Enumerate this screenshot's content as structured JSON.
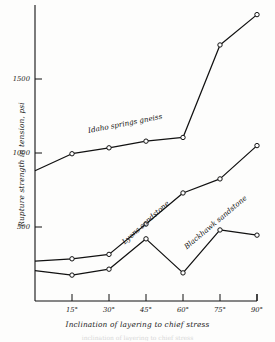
{
  "chart_data": {
    "type": "line",
    "title": "",
    "xlabel": "Inclination of layering to chief stress",
    "ylabel": "Rupture strength in tension, psi",
    "x": [
      0,
      15,
      30,
      45,
      60,
      75,
      90
    ],
    "xtick_labels": [
      "15°",
      "30°",
      "45°",
      "60°",
      "75°",
      "90°"
    ],
    "xtick_values": [
      15,
      30,
      45,
      60,
      75,
      90
    ],
    "ytick_labels": [
      "500",
      "1000",
      "1500"
    ],
    "ytick_values": [
      500,
      1000,
      1500
    ],
    "xlim": [
      0,
      90
    ],
    "ylim": [
      0,
      2000
    ],
    "grid": false,
    "legend_position": "inline-labels",
    "marker": "open-circle",
    "line_color": "#111111",
    "series": [
      {
        "name": "Idaho springs gneiss",
        "label": "Idaho springs gneiss",
        "values": [
          880,
          995,
          1035,
          1080,
          1105,
          1730,
          1935
        ]
      },
      {
        "name": "Lyons sandstone",
        "label": "Lyons sandstone",
        "values": [
          270,
          285,
          315,
          520,
          730,
          825,
          1050
        ]
      },
      {
        "name": "Blackhawk sandstone",
        "label": "Blackhawk sandstone",
        "values": [
          205,
          175,
          215,
          420,
          190,
          480,
          445
        ]
      }
    ],
    "annotations": [
      {
        "text": "Idaho springs gneiss",
        "x": 22,
        "y": 1180,
        "rotation": -11
      },
      {
        "text": "Lyons sandstone",
        "x": 37,
        "y": 430,
        "rotation": -42
      },
      {
        "text": "Blackhawk sandstone",
        "x": 62,
        "y": 400,
        "rotation": -40
      }
    ]
  },
  "figure": {
    "bottom_caption": "inclination of layering to chief stress"
  }
}
